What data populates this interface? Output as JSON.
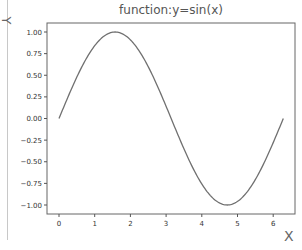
{
  "chart_data": {
    "type": "line",
    "title": "function:y=sin(x)",
    "xlabel": "X",
    "ylabel": "Y",
    "xlim": [
      -0.31,
      6.59
    ],
    "ylim": [
      -1.1,
      1.1
    ],
    "xticks": [
      "0",
      "1",
      "2",
      "3",
      "4",
      "5",
      "6"
    ],
    "yticks": [
      "1.00",
      "0.75",
      "0.50",
      "0.25",
      "0.00",
      "-0.25",
      "-0.50",
      "-0.75",
      "-1.00"
    ],
    "grid": false,
    "series": [
      {
        "name": "sin(x)",
        "color": "#707070",
        "x": [
          0,
          0.5,
          1,
          1.5,
          1.5708,
          2,
          2.5,
          3,
          3.1416,
          3.5,
          4,
          4.5,
          4.7124,
          5,
          5.5,
          6,
          6.2832
        ],
        "y": [
          0,
          0.479,
          0.841,
          0.997,
          1.0,
          0.909,
          0.598,
          0.141,
          0,
          -0.351,
          -0.757,
          -0.978,
          -1.0,
          -0.959,
          -0.706,
          -0.279,
          0
        ]
      }
    ]
  }
}
